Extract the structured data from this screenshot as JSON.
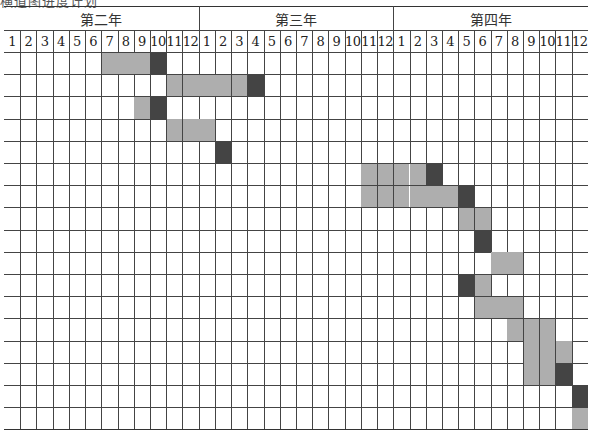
{
  "header": {
    "clipped_text": "横道图进度计划"
  },
  "chart_data": {
    "type": "table",
    "title": "",
    "layout": {
      "columns": 36,
      "rows": 17,
      "col_width": 16.22,
      "row_height": 22.2,
      "grid": true
    },
    "years": [
      {
        "label": "第二年",
        "months": [
          "1",
          "2",
          "3",
          "4",
          "5",
          "6",
          "7",
          "8",
          "9",
          "10",
          "11",
          "12"
        ]
      },
      {
        "label": "第三年",
        "months": [
          "1",
          "2",
          "3",
          "4",
          "5",
          "6",
          "7",
          "8",
          "9",
          "10",
          "11",
          "12"
        ]
      },
      {
        "label": "第四年",
        "months": [
          "1",
          "2",
          "3",
          "4",
          "5",
          "6",
          "7",
          "8",
          "9",
          "10",
          "11",
          "12"
        ]
      }
    ],
    "colors": {
      "light": "#aeaeae",
      "dark": "#444444"
    },
    "legend": {
      "light": "planned duration",
      "dark": "milestone / completion"
    },
    "rows_data": [
      {
        "row": 1,
        "light": [
          7,
          8,
          9
        ],
        "dark": [
          10
        ]
      },
      {
        "row": 2,
        "light": [
          11,
          12,
          13,
          14,
          15
        ],
        "dark": [
          16
        ]
      },
      {
        "row": 3,
        "light": [
          9
        ],
        "dark": [
          10
        ]
      },
      {
        "row": 4,
        "light": [
          11,
          12,
          13
        ],
        "dark": []
      },
      {
        "row": 5,
        "light": [],
        "dark": [
          14
        ]
      },
      {
        "row": 6,
        "light": [
          23,
          24,
          25,
          26
        ],
        "dark": [
          27
        ]
      },
      {
        "row": 7,
        "light": [
          23,
          24,
          25,
          26,
          27,
          28
        ],
        "dark": [
          29
        ]
      },
      {
        "row": 8,
        "light": [
          29,
          30
        ],
        "dark": []
      },
      {
        "row": 9,
        "light": [],
        "dark": [
          30
        ]
      },
      {
        "row": 10,
        "light": [
          31,
          32
        ],
        "dark": []
      },
      {
        "row": 11,
        "light": [
          30
        ],
        "dark": [
          29
        ]
      },
      {
        "row": 12,
        "light": [
          30,
          31,
          32
        ],
        "dark": []
      },
      {
        "row": 13,
        "light": [
          32,
          33,
          34
        ],
        "dark": []
      },
      {
        "row": 14,
        "light": [
          33,
          34,
          35
        ],
        "dark": []
      },
      {
        "row": 15,
        "light": [
          33,
          34
        ],
        "dark": [
          35
        ]
      },
      {
        "row": 16,
        "light": [],
        "dark": [
          36
        ]
      },
      {
        "row": 17,
        "light": [
          36
        ],
        "dark": []
      }
    ]
  }
}
